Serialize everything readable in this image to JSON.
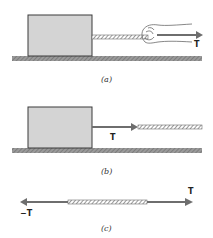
{
  "diagram": {
    "colors": {
      "block_fill": "#d4d4d4",
      "block_stroke": "#3a3a3a",
      "floor": "#8a8a8a",
      "arrow": "#6e6e6e",
      "rope": "#7a7a7a"
    },
    "panels": [
      {
        "id": "a",
        "caption": "(a)",
        "description": "Hand pulls a rope attached to a block resting on the floor",
        "vectors": [
          {
            "label": "T",
            "direction": "right"
          }
        ]
      },
      {
        "id": "b",
        "caption": "(b)",
        "description": "Rope exerts tension T on the block",
        "vectors": [
          {
            "label": "T",
            "direction": "right"
          }
        ]
      },
      {
        "id": "c",
        "caption": "(c)",
        "description": "Rope segment with equal and opposite forces at its ends",
        "vectors": [
          {
            "label": "T",
            "direction": "right"
          },
          {
            "label": "−T",
            "direction": "left"
          }
        ]
      }
    ]
  }
}
